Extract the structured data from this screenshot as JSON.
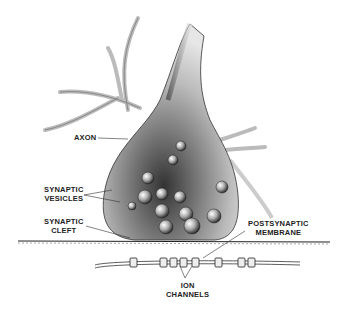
{
  "diagram": {
    "labels": {
      "axon": [
        "AXON"
      ],
      "synaptic_vesicles": [
        "SYNAPTIC",
        "VESICLES"
      ],
      "synaptic_cleft": [
        "SYNAPTIC",
        "CLEFT"
      ],
      "postsynaptic_membrane": [
        "POSTSYNAPTIC",
        "MEMBRANE"
      ],
      "ion_channels": [
        "ION",
        "CHANNELS"
      ]
    },
    "colors": {
      "ink": "#222222",
      "stipple": "#555555",
      "background": "#ffffff"
    }
  }
}
